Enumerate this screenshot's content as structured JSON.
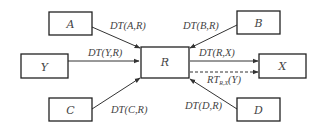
{
  "diagram": {
    "nodes": {
      "A": {
        "label": "A"
      },
      "B": {
        "label": "B"
      },
      "Y": {
        "label": "Y"
      },
      "R": {
        "label": "R"
      },
      "X": {
        "label": "X"
      },
      "C": {
        "label": "C"
      },
      "D": {
        "label": "D"
      }
    },
    "edges": {
      "A_R": {
        "label": "DT(A,R)",
        "from": "A",
        "to": "R",
        "style": "solid"
      },
      "B_R": {
        "label": "DT(B,R)",
        "from": "B",
        "to": "R",
        "style": "solid"
      },
      "Y_R": {
        "label": "DT(Y,R)",
        "from": "Y",
        "to": "R",
        "style": "solid"
      },
      "R_X": {
        "label": "DT(R,X)",
        "from": "R",
        "to": "X",
        "style": "solid"
      },
      "RT": {
        "label_main": "RT",
        "label_sub": "R,X",
        "label_tail": "(Y)",
        "from": "R",
        "to": "X",
        "style": "dashed"
      },
      "C_R": {
        "label": "DT(C,R)",
        "from": "C",
        "to": "R",
        "style": "solid"
      },
      "D_R": {
        "label": "DT(D,R)",
        "from": "D",
        "to": "R",
        "style": "solid"
      }
    },
    "colors": {
      "stroke": "#222222",
      "text": "#444444",
      "background": "#ffffff"
    }
  }
}
